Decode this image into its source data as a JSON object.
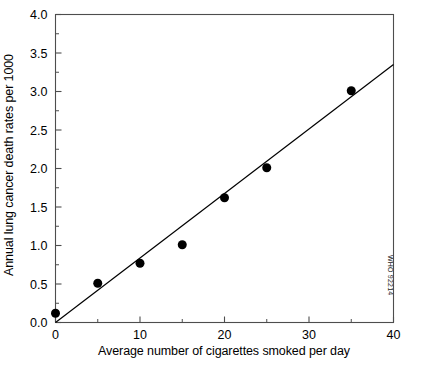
{
  "chart_data": {
    "type": "scatter",
    "title": "",
    "xlabel": "Average number of cigarettes smoked per day",
    "ylabel": "Annual lung cancer death rates per 1000",
    "xlim": [
      0,
      40
    ],
    "ylim": [
      0.0,
      4.0
    ],
    "x_major_ticks": [
      0,
      10,
      20,
      30,
      40
    ],
    "x_major_tick_labels": [
      "0",
      "10",
      "20",
      "30",
      "40"
    ],
    "x_minor_ticks": [
      5,
      15,
      25,
      35
    ],
    "y_major_ticks": [
      0.0,
      0.5,
      1.0,
      1.5,
      2.0,
      2.5,
      3.0,
      3.5,
      4.0
    ],
    "y_major_tick_labels": [
      "0.0",
      "0.5",
      "1.0",
      "1.5",
      "2.0",
      "2.5",
      "3.0",
      "3.5",
      "4.0"
    ],
    "y_minor_ticks": [
      0.25,
      0.75,
      1.25,
      1.75,
      2.25,
      2.75,
      3.25,
      3.75
    ],
    "grid": false,
    "legend": false,
    "x": [
      0,
      5,
      10,
      15,
      20,
      25,
      35
    ],
    "values": [
      0.12,
      0.51,
      0.77,
      1.01,
      1.62,
      2.01,
      3.01
    ],
    "points": [
      {
        "x": 0,
        "y": 0.12
      },
      {
        "x": 5,
        "y": 0.51
      },
      {
        "x": 10,
        "y": 0.77
      },
      {
        "x": 15,
        "y": 1.01
      },
      {
        "x": 20,
        "y": 1.62
      },
      {
        "x": 25,
        "y": 2.01
      },
      {
        "x": 35,
        "y": 3.01
      }
    ],
    "marker": {
      "shape": "circle",
      "color": "#000000",
      "size": 9
    },
    "trend_line": {
      "type": "linear",
      "x_start": 0,
      "y_start": 0.0,
      "x_end": 40,
      "y_end": 3.35,
      "color": "#000000",
      "width": 1.2
    },
    "axes_color": "#4d4d4d",
    "background_color": "#ffffff"
  },
  "watermark": {
    "text": "WHO 92214"
  }
}
